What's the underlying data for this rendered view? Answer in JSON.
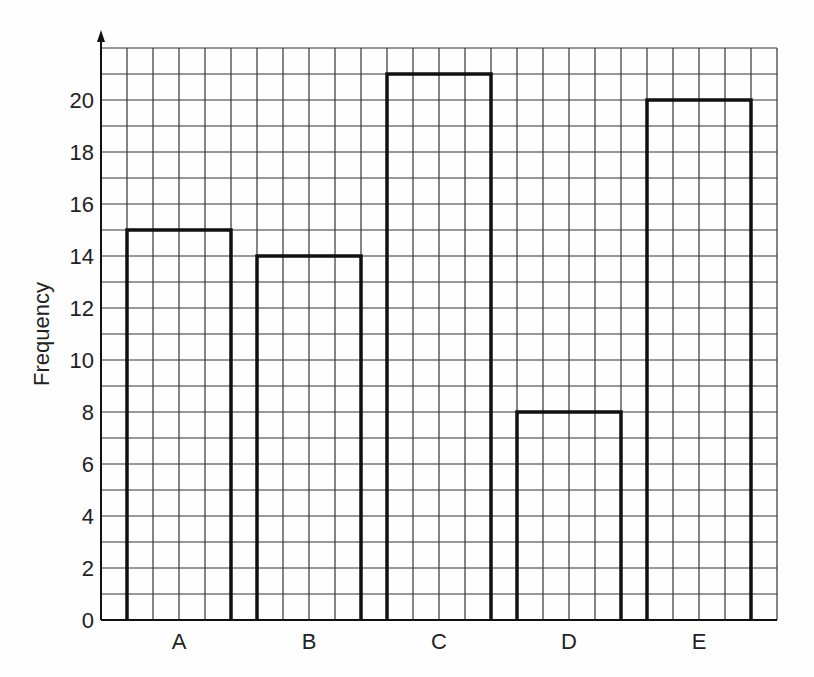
{
  "chart_data": {
    "type": "bar",
    "title": "",
    "xlabel": "",
    "ylabel": "Frequency",
    "categories": [
      "A",
      "B",
      "C",
      "D",
      "E"
    ],
    "values": [
      15,
      14,
      21,
      8,
      20
    ],
    "ylim": [
      0,
      22
    ],
    "y_ticks": [
      0,
      2,
      4,
      6,
      8,
      10,
      12,
      14,
      16,
      18,
      20
    ],
    "grid": true,
    "grid_minor_step": 1,
    "legend": null,
    "bar_style": "outline",
    "colors": {
      "bar_stroke": "#111111",
      "grid": "#333333",
      "background": "#fefefe"
    }
  }
}
